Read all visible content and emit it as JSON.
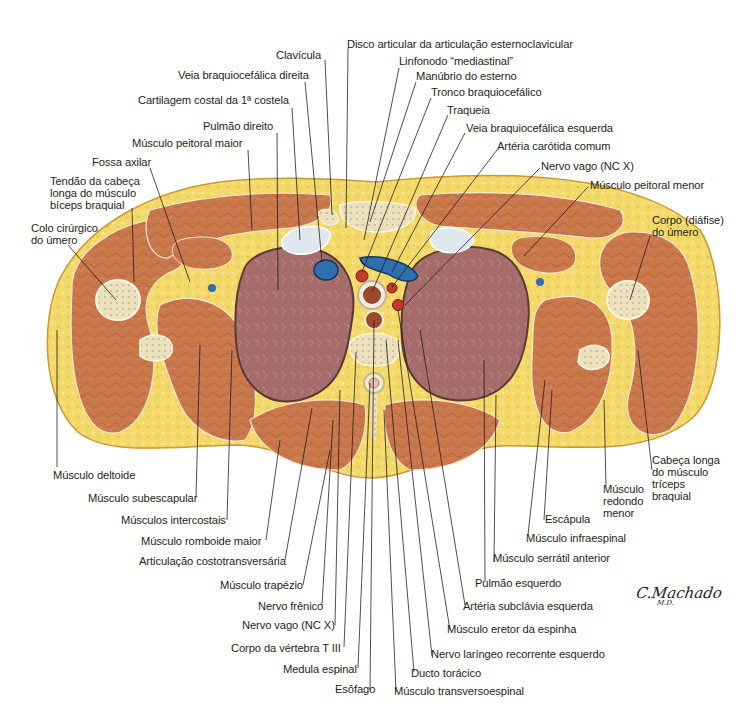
{
  "figure": {
    "signature": "C.Machado",
    "signature_suffix": "M.D.",
    "colors": {
      "fat": "#f3d86a",
      "fat_dark": "#e4bf3c",
      "muscle": "#c9774b",
      "muscle_dark": "#a95a35",
      "lung": "#a86a6a",
      "lung_border": "#5a3a36",
      "bone": "#ede3c4",
      "vein": "#2f6fae",
      "artery": "#c0392b",
      "cartilage": "#dfe8ee"
    }
  },
  "labels": {
    "clavicula": "Clavícula",
    "disco_articular": "Disco articular da articulação esternoclavicular",
    "veia_braquiocefalica_direita": "Veia braquiocefálica direita",
    "linfonodo": "Linfonodo “mediastinal”",
    "manubrio": "Manúbrio do esterno",
    "cartilagem_costal": "Cartilagem costal da 1ª costela",
    "tronco_braquiocefalico": "Tronco braquiocefálico",
    "traqueia": "Traqueia",
    "pulmao_direito": "Pulmão direito",
    "veia_braquiocefalica_esquerda": "Veia braquiocefálica esquerda",
    "musculo_peitoral_maior": "Músculo peitoral maior",
    "arteria_carotida": "Artéria carótida comum",
    "fossa_axilar": "Fossa axilar",
    "nervo_vago_top": "Nervo vago (NC X)",
    "tendao_biceps": "Tendão da cabeça\nlonga do músculo\nbíceps braquial",
    "musculo_peitoral_menor": "Músculo peitoral menor",
    "colo_cirurgico": "Colo cirúrgico\ndo úmero",
    "corpo_umero": "Corpo (diáfise)\ndo úmero",
    "musculo_deltoide": "Músculo deltoide",
    "cabeca_longa_triceps": "Cabeça longa\ndo músculo\ntríceps\nbraquial",
    "musculo_subescapular": "Músculo subescapular",
    "musculo_redondo_menor": "Músculo\nredondo\nmenor",
    "musculos_intercostais": "Músculos intercostais",
    "escapula": "Escápula",
    "musculo_romboide": "Músculo romboide maior",
    "musculo_infraespinal": "Músculo infraespinal",
    "articulacao_costotransversaria": "Articulação costotransversária",
    "musculo_serratil": "Músculo serrátil anterior",
    "musculo_trapezio": "Músculo trapézio",
    "pulmao_esquerdo": "Pulmão esquerdo",
    "nervo_frenico": "Nervo frênico",
    "arteria_subclavia": "Artéria subclávia esquerda",
    "nervo_vago_bottom": "Nervo vago (NC X)",
    "musculo_eretor": "Músculo eretor da espinha",
    "corpo_vertebra": "Corpo da vértebra T III",
    "nervo_laringeo": "Nervo laríngeo recorrente esquerdo",
    "medula_espinal": "Medula espinal",
    "ducto_toracico": "Ducto torácico",
    "esofago": "Esôfago",
    "musculo_transversoespinal": "Músculo transversoespinal"
  }
}
